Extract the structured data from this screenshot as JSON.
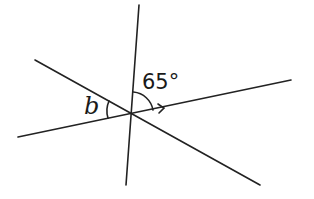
{
  "diagram": {
    "angle_given": "65°",
    "angle_unknown": "b",
    "intersection": {
      "x": 132,
      "y": 114
    },
    "lines": [
      {
        "name": "vertical-line",
        "x1": 139,
        "y1": 5,
        "x2": 126,
        "y2": 185
      },
      {
        "name": "shallow-line",
        "x1": 18,
        "y1": 137,
        "x2": 291,
        "y2": 80
      },
      {
        "name": "diagonal-line",
        "x1": 35,
        "y1": 60,
        "x2": 260,
        "y2": 185
      }
    ],
    "stroke_color": "#222222"
  }
}
